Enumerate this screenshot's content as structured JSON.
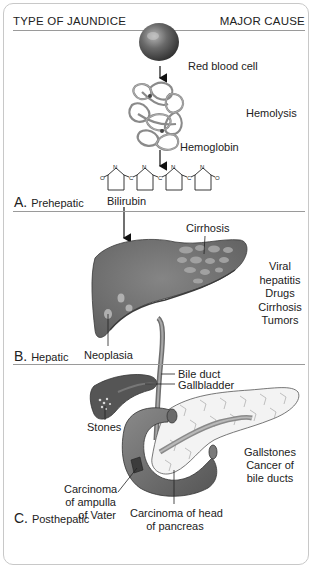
{
  "header": {
    "left": "TYPE OF JAUNDICE",
    "right": "MAJOR CAUSE"
  },
  "sections": [
    {
      "letter": "A.",
      "name": "Prehepatic",
      "labels": [
        "Red blood cell",
        "Hemoglobin",
        "Bilirubin"
      ],
      "causes": [
        "Hemolysis"
      ]
    },
    {
      "letter": "B.",
      "name": "Hepatic",
      "labels": [
        "Cirrhosis",
        "Neoplasia"
      ],
      "causes": [
        "Viral",
        "hepatitis",
        "Drugs",
        "Cirrhosis",
        "Tumors"
      ]
    },
    {
      "letter": "C.",
      "name": "Posthepatic",
      "labels": [
        "Bile duct",
        "Gallbladder",
        "Stones",
        "Carcinoma",
        "of ampulla",
        "of Vater",
        "Carcinoma of head",
        "of pancreas"
      ],
      "causes": [
        "Gallstones",
        "Cancer of",
        "bile ducts"
      ]
    }
  ],
  "bilirubin_atoms": {
    "o": "O",
    "n": "N",
    "c": "C"
  },
  "colors": {
    "organ": "#6f6f6f",
    "organ_dark": "#4a4a4a",
    "pancreas": "#f2f2f2",
    "rule": "#9a9a9a",
    "border": "#c8c8c8"
  }
}
